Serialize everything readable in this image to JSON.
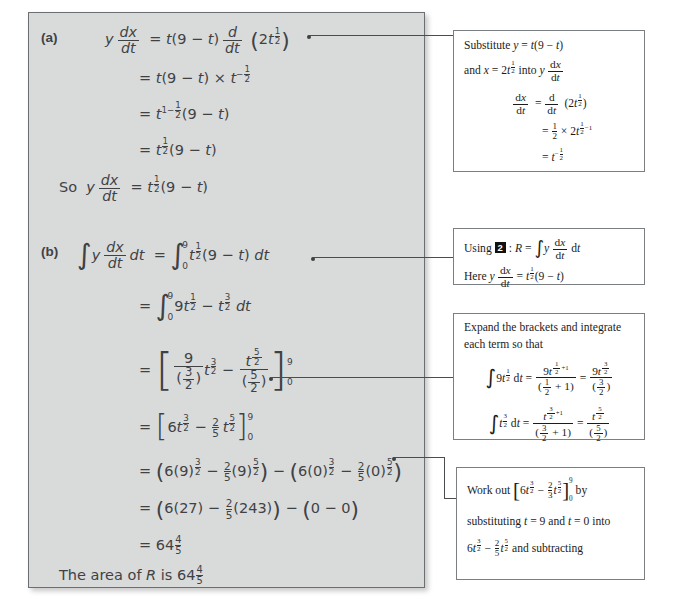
{
  "document": {
    "title": "Worked solution: integration to find area of R",
    "panel_background": "#d9dada",
    "ink_color": "#3f4245",
    "note_border_color": "#7b7f82"
  },
  "solution": {
    "part_a": {
      "label": "(a)",
      "lines": [
        "y dx/dt = t(9 − t) d/dt (2t^(1/2))",
        "= t(9 − t) × t^(−1/2)",
        "= t^(1 − 1/2)(9 − t)",
        "= t^(1/2)(9 − t)"
      ],
      "conclusion_prefix": "So",
      "conclusion": "y dx/dt = t^(1/2)(9 − t)"
    },
    "part_b": {
      "label": "(b)",
      "lines": [
        "∫ y dx/dt dt = ∫₀⁹ t^(1/2)(9 − t) dt",
        "= ∫₀⁹ 9t^(1/2) − t^(3/2) dt",
        "= [ 9/(3/2) t^(3/2) − t^(5/2)/(5/2) ]₀⁹",
        "= [ 6t^(3/2) − (2/5) t^(5/2) ]₀⁹",
        "= (6(9)^(3/2) − (2/5)(9)^(5/2)) − (6(0)^(3/2) − (2/5)(0)^(5/2))",
        "= (6(27) − (2/5)(243)) − (0 − 0)",
        "= 64 4/5"
      ],
      "final_statement": "The area of R is 64 4/5"
    }
  },
  "notes": [
    {
      "id": "note-substitute",
      "text_lines": [
        "Substitute y = t(9 − t)",
        "and x = 2t^(1/2) into y dx/dt",
        "dx/dt = d/dt (2t^(1/2))",
        "= 1/2 × 2t^(1/2 − 1)",
        "= t^(−1/2)"
      ]
    },
    {
      "id": "note-using-2",
      "box_number": "2",
      "text_lines": [
        "Using 2 : R = ∫ y dx/dt dt",
        "Here y dx/dt = t^(1/2)(9 − t)"
      ]
    },
    {
      "id": "note-expand-integrate",
      "text_lines": [
        "Expand the brackets and integrate",
        "each term so that",
        "∫ 9t^(1/2) dt = 9t^(1/2 + 1) / ((1/2) + 1) = 9t^(3/2) / (3/2)",
        "∫ t^(3/2) dt = t^(3/2 + 1) / ((3/2) + 1) = t^(5/2) / (5/2)"
      ]
    },
    {
      "id": "note-work-out",
      "text_lines": [
        "Work out [6t^(3/2) − (2/5)t^(5/2)]₀⁹ by",
        "substituting t = 9 and t = 0 into",
        "6t^(3/2) − (2/5)t^(5/2) and subtracting"
      ]
    }
  ]
}
